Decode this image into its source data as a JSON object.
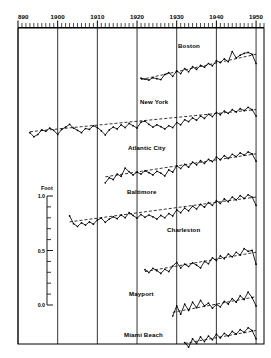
{
  "figure": {
    "background": "#ffffff",
    "line_color": "#000000",
    "frame": {
      "x": 18,
      "y": 28,
      "width": 246,
      "height": 316
    }
  },
  "chart_data": {
    "type": "line",
    "title": "",
    "xlabel": "",
    "ylabel": "Foot",
    "xlim": [
      1890,
      1952
    ],
    "grid": true,
    "grid_axis": "x",
    "legend_position": "inline-annotations",
    "x_ticks_major": [
      1890,
      1900,
      1910,
      1920,
      1930,
      1940,
      1950
    ],
    "x_tick_labels": [
      "890",
      "1900",
      "1910",
      "1920",
      "1930",
      "1940",
      "1950"
    ],
    "x_minor_tick_interval": 1,
    "scale_bar": {
      "title": "Foot",
      "ticks": [
        1.0,
        0.5,
        0.0
      ],
      "tick_labels": [
        "1.0",
        "0.5",
        "0.0"
      ],
      "minor_interval": 0.1,
      "x": 47,
      "y_top": 196,
      "y_bottom": 305
    },
    "series": [
      {
        "name": "Boston",
        "label": "Boston",
        "label_x": 178,
        "label_y": 48,
        "baseline_y": 92,
        "scale": 46,
        "x": [
          1921,
          1922,
          1923,
          1924,
          1925,
          1926,
          1927,
          1928,
          1929,
          1930,
          1931,
          1932,
          1933,
          1934,
          1935,
          1936,
          1937,
          1938,
          1939,
          1940,
          1941,
          1942,
          1943,
          1944,
          1945,
          1946,
          1947,
          1948,
          1949,
          1950
        ],
        "values": [
          0.3,
          0.28,
          0.26,
          0.31,
          0.29,
          0.27,
          0.38,
          0.42,
          0.34,
          0.46,
          0.4,
          0.51,
          0.44,
          0.55,
          0.49,
          0.58,
          0.54,
          0.62,
          0.57,
          0.68,
          0.64,
          0.72,
          0.66,
          0.88,
          0.74,
          0.8,
          0.84,
          0.86,
          0.82,
          0.62
        ],
        "trend": [
          [
            1921,
            0.27
          ],
          [
            1950,
            0.82
          ]
        ]
      },
      {
        "name": "New York",
        "label": "New York",
        "label_x": 140,
        "label_y": 104,
        "baseline_y": 140,
        "scale": 46,
        "x": [
          1893,
          1894,
          1895,
          1896,
          1897,
          1898,
          1899,
          1900,
          1901,
          1902,
          1903,
          1904,
          1905,
          1906,
          1907,
          1908,
          1909,
          1910,
          1911,
          1912,
          1913,
          1914,
          1915,
          1916,
          1917,
          1918,
          1919,
          1920,
          1921,
          1922,
          1923,
          1924,
          1925,
          1926,
          1927,
          1928,
          1929,
          1930,
          1931,
          1932,
          1933,
          1934,
          1935,
          1936,
          1937,
          1938,
          1939,
          1940,
          1941,
          1942,
          1943,
          1944,
          1945,
          1946,
          1947,
          1948,
          1949,
          1950
        ],
        "values": [
          0.16,
          0.07,
          0.12,
          0.22,
          0.19,
          0.26,
          0.21,
          0.12,
          0.23,
          0.28,
          0.34,
          0.26,
          0.21,
          0.16,
          0.25,
          0.23,
          0.31,
          0.27,
          0.2,
          0.11,
          0.22,
          0.28,
          0.24,
          0.33,
          0.27,
          0.36,
          0.31,
          0.26,
          0.39,
          0.41,
          0.34,
          0.28,
          0.33,
          0.29,
          0.24,
          0.31,
          0.27,
          0.38,
          0.33,
          0.44,
          0.4,
          0.48,
          0.43,
          0.52,
          0.47,
          0.56,
          0.51,
          0.6,
          0.55,
          0.63,
          0.58,
          0.66,
          0.61,
          0.68,
          0.64,
          0.71,
          0.66,
          0.52
        ],
        "trend": [
          [
            1893,
            0.18
          ],
          [
            1950,
            0.66
          ]
        ]
      },
      {
        "name": "Atlantic City",
        "label": "Atlantic City",
        "label_x": 128,
        "label_y": 150,
        "baseline_y": 186,
        "scale": 46,
        "x": [
          1912,
          1913,
          1914,
          1915,
          1916,
          1917,
          1918,
          1919,
          1920,
          1921,
          1922,
          1923,
          1924,
          1925,
          1926,
          1927,
          1928,
          1929,
          1930,
          1931,
          1932,
          1933,
          1934,
          1935,
          1936,
          1937,
          1938,
          1939,
          1940,
          1941,
          1942,
          1943,
          1944,
          1945,
          1946,
          1947,
          1948,
          1949,
          1950
        ],
        "values": [
          0.07,
          0.18,
          0.14,
          0.26,
          0.21,
          0.39,
          0.31,
          0.24,
          0.3,
          0.26,
          0.33,
          0.29,
          0.24,
          0.32,
          0.28,
          0.22,
          0.35,
          0.3,
          0.44,
          0.38,
          0.47,
          0.41,
          0.52,
          0.46,
          0.55,
          0.49,
          0.58,
          0.53,
          0.63,
          0.57,
          0.66,
          0.6,
          0.69,
          0.64,
          0.72,
          0.67,
          0.74,
          0.7,
          0.54
        ],
        "trend": [
          [
            1912,
            0.2
          ],
          [
            1950,
            0.7
          ]
        ]
      },
      {
        "name": "Baltimore",
        "label": "Baltimore",
        "label_x": 127,
        "label_y": 194,
        "baseline_y": 232,
        "scale": 46,
        "x": [
          1903,
          1904,
          1905,
          1906,
          1907,
          1908,
          1909,
          1910,
          1911,
          1912,
          1913,
          1914,
          1915,
          1916,
          1917,
          1918,
          1919,
          1920,
          1921,
          1922,
          1923,
          1924,
          1925,
          1926,
          1927,
          1928,
          1929,
          1930,
          1931,
          1932,
          1933,
          1934,
          1935,
          1936,
          1937,
          1938,
          1939,
          1940,
          1941,
          1942,
          1943,
          1944,
          1945,
          1946,
          1947,
          1948,
          1949,
          1950
        ],
        "values": [
          0.35,
          0.18,
          0.12,
          0.2,
          0.15,
          0.22,
          0.17,
          0.26,
          0.3,
          0.21,
          0.28,
          0.33,
          0.29,
          0.37,
          0.31,
          0.42,
          0.36,
          0.3,
          0.38,
          0.32,
          0.37,
          0.33,
          0.28,
          0.36,
          0.31,
          0.4,
          0.35,
          0.48,
          0.42,
          0.52,
          0.46,
          0.56,
          0.5,
          0.6,
          0.54,
          0.64,
          0.58,
          0.68,
          0.62,
          0.72,
          0.66,
          0.76,
          0.7,
          0.79,
          0.73,
          0.81,
          0.76,
          0.58
        ],
        "trend": [
          [
            1903,
            0.22
          ],
          [
            1950,
            0.76
          ]
        ]
      },
      {
        "name": "Charleston",
        "label": "Charleston",
        "label_x": 167,
        "label_y": 232,
        "baseline_y": 278,
        "scale": 46,
        "x": [
          1922,
          1923,
          1924,
          1925,
          1926,
          1927,
          1928,
          1929,
          1930,
          1931,
          1932,
          1933,
          1934,
          1935,
          1936,
          1937,
          1938,
          1939,
          1940,
          1941,
          1942,
          1943,
          1944,
          1945,
          1946,
          1947,
          1948,
          1949,
          1950
        ],
        "values": [
          0.18,
          0.12,
          0.21,
          0.16,
          0.1,
          0.19,
          0.14,
          0.26,
          0.34,
          0.22,
          0.3,
          0.25,
          0.33,
          0.28,
          0.22,
          0.36,
          0.31,
          0.44,
          0.38,
          0.48,
          0.42,
          0.52,
          0.46,
          0.56,
          0.5,
          0.64,
          0.58,
          0.6,
          0.3
        ],
        "trend": [
          [
            1922,
            0.14
          ],
          [
            1950,
            0.56
          ]
        ]
      },
      {
        "name": "Mayport",
        "label": "Mayport",
        "label_x": 129,
        "label_y": 296,
        "baseline_y": 316,
        "scale": 46,
        "x": [
          1929,
          1930,
          1931,
          1932,
          1933,
          1934,
          1935,
          1936,
          1937,
          1938,
          1939,
          1940,
          1941,
          1942,
          1943,
          1944,
          1945,
          1946,
          1947,
          1948,
          1949,
          1950
        ],
        "values": [
          0.0,
          0.22,
          0.04,
          0.26,
          0.12,
          0.3,
          0.18,
          0.34,
          0.22,
          0.28,
          0.17,
          0.25,
          0.2,
          0.32,
          0.26,
          0.38,
          0.3,
          0.44,
          0.36,
          0.52,
          0.4,
          0.22
        ],
        "trend": [
          [
            1929,
            0.08
          ],
          [
            1950,
            0.42
          ]
        ]
      },
      {
        "name": "Miami Beach",
        "label": "Miami Beach",
        "label_x": 124,
        "label_y": 337,
        "baseline_y": 348,
        "scale": 46,
        "x": [
          1932,
          1933,
          1934,
          1935,
          1936,
          1937,
          1938,
          1939,
          1940,
          1941,
          1942,
          1943,
          1944,
          1945,
          1946,
          1947,
          1948,
          1949,
          1950
        ],
        "values": [
          0.12,
          0.02,
          0.2,
          0.1,
          0.24,
          0.14,
          0.26,
          0.18,
          0.3,
          0.22,
          0.32,
          0.26,
          0.36,
          0.3,
          0.4,
          0.34,
          0.44,
          0.38,
          0.2
        ],
        "trend": [
          [
            1932,
            0.1
          ],
          [
            1950,
            0.38
          ]
        ]
      }
    ]
  }
}
